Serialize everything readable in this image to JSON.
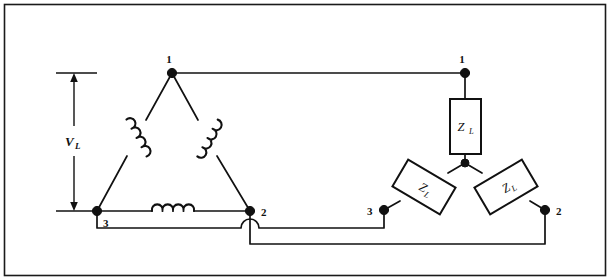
{
  "figure": {
    "border_color": "#1a1a1a",
    "line_color": "#111111",
    "background": "#ffffff"
  },
  "dimension": {
    "label": "V",
    "subscript": "L",
    "name": "line-voltage-dimension"
  },
  "delta": {
    "name": "delta-connected-source",
    "nodes": [
      {
        "id": "delta-node-1",
        "label": "1",
        "x": 172,
        "y": 73
      },
      {
        "id": "delta-node-2",
        "label": "2",
        "x": 250,
        "y": 211
      },
      {
        "id": "delta-node-3",
        "label": "3",
        "x": 97,
        "y": 211
      }
    ],
    "coils": [
      {
        "id": "delta-coil-left",
        "between": "3-1"
      },
      {
        "id": "delta-coil-right",
        "between": "1-2"
      },
      {
        "id": "delta-coil-bottom",
        "between": "3-2"
      }
    ]
  },
  "wye": {
    "name": "wye-connected-load",
    "center": {
      "x": 465,
      "y": 163
    },
    "nodes": [
      {
        "id": "wye-node-1",
        "label": "1",
        "x": 465,
        "y": 71
      },
      {
        "id": "wye-node-2",
        "label": "2",
        "x": 545,
        "y": 210
      },
      {
        "id": "wye-node-3",
        "label": "3",
        "x": 384,
        "y": 210
      }
    ],
    "impedances": [
      {
        "id": "impedance-top",
        "label": "Z",
        "subscript": "L",
        "orientation": "vertical"
      },
      {
        "id": "impedance-left",
        "label": "Z",
        "subscript": "L",
        "orientation": "diagonal-left"
      },
      {
        "id": "impedance-right",
        "label": "Z",
        "subscript": "L",
        "orientation": "diagonal-right"
      }
    ]
  },
  "connections": [
    {
      "id": "line-1",
      "from": "delta-node-1",
      "to": "wye-node-1",
      "route": "top-horizontal"
    },
    {
      "id": "line-3",
      "from": "delta-node-3",
      "to": "wye-node-3",
      "route": "lower-horizontal-with-hop"
    },
    {
      "id": "line-2",
      "from": "delta-node-2",
      "to": "wye-node-2",
      "route": "bottom-horizontal"
    }
  ]
}
